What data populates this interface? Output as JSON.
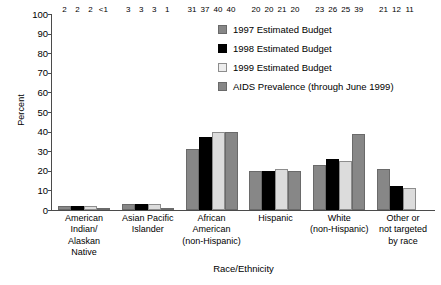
{
  "chart_data": {
    "type": "bar",
    "title": "",
    "xlabel": "Race/Ethnicity",
    "ylabel": "Percent",
    "ylim": [
      0,
      100
    ],
    "yticks": [
      0,
      10,
      20,
      30,
      40,
      50,
      60,
      70,
      80,
      90,
      100
    ],
    "ytick_labels": [
      "0",
      "10",
      "20",
      "30",
      "40",
      "50",
      "60",
      "70",
      "80",
      "90",
      "100"
    ],
    "grid": false,
    "legend_position": "top-right",
    "categories": [
      "American Indian/ Alaskan Native",
      "Asian Pacific Islander",
      "African American (non-Hispanic)",
      "Hispanic",
      "White (non-Hispanic)",
      "Other or not targeted by race"
    ],
    "category_lines": [
      [
        "American",
        "Indian/",
        "Alaskan",
        "Native"
      ],
      [
        "Asian Pacific",
        "Islander"
      ],
      [
        "African",
        "American",
        "(non-Hispanic)"
      ],
      [
        "Hispanic"
      ],
      [
        "White",
        "(non-Hispanic)"
      ],
      [
        "Other or",
        "not targeted",
        "by race"
      ]
    ],
    "series": [
      {
        "name": "1997 Estimated Budget",
        "color": "#878787",
        "values": [
          2,
          3,
          31,
          20,
          23,
          21
        ],
        "labels": [
          "2",
          "3",
          "31",
          "20",
          "23",
          "21"
        ]
      },
      {
        "name": "1998 Estimated Budget",
        "color": "#000000",
        "values": [
          2,
          3,
          37,
          20,
          26,
          12
        ],
        "labels": [
          "2",
          "3",
          "37",
          "20",
          "26",
          "12"
        ]
      },
      {
        "name": "1999 Estimated Budget",
        "color": "#ededed",
        "values": [
          2,
          3,
          40,
          21,
          25,
          11
        ],
        "labels": [
          "2",
          "3",
          "40",
          "21",
          "25",
          "11"
        ]
      },
      {
        "name": "AIDS Prevalence (through June 1999)",
        "color": "#878787",
        "values": [
          0.6,
          1,
          40,
          20,
          39,
          null
        ],
        "labels": [
          "<1",
          "1",
          "40",
          "20",
          "39",
          ""
        ]
      }
    ]
  }
}
